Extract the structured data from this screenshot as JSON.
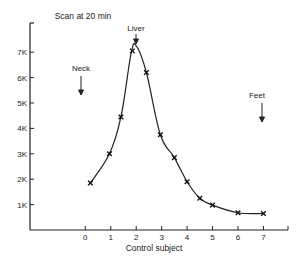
{
  "chart_data": {
    "type": "line",
    "title": "Scan at 20 min",
    "xlabel": "Control subject",
    "ylabel": "",
    "x_ticks": [
      "0",
      "1",
      "2",
      "3",
      "4",
      "5",
      "6",
      "7"
    ],
    "y_ticks": [
      "1K",
      "2K",
      "3K",
      "4K",
      "5K",
      "6K",
      "7K"
    ],
    "xlim": [
      -2.1,
      8.0
    ],
    "ylim": [
      0,
      8.0
    ],
    "grid": false,
    "legend": null,
    "series": [
      {
        "name": "Measured counts",
        "marker": "x",
        "x": [
          0.2,
          0.95,
          1.4,
          1.85,
          2.4,
          2.95,
          3.5,
          4.0,
          4.5,
          5.0,
          6.0,
          7.0
        ],
        "y": [
          1.85,
          3.0,
          4.45,
          7.05,
          6.2,
          3.75,
          2.85,
          1.9,
          1.25,
          0.98,
          0.68,
          0.65
        ]
      }
    ],
    "curve_peak": {
      "x": 2.0,
      "y": 7.25
    },
    "annotations": [
      {
        "text": "Neck",
        "x": -0.15,
        "arrow": true
      },
      {
        "text": "Liver",
        "x": 2.0,
        "arrow": true
      },
      {
        "text": "Feet",
        "x": 6.95,
        "arrow": true
      }
    ]
  },
  "labels": {
    "title": "Scan at 20 min",
    "xlabel": "Control subject",
    "neck": "Neck",
    "liver": "Liver",
    "feet": "Feet"
  }
}
